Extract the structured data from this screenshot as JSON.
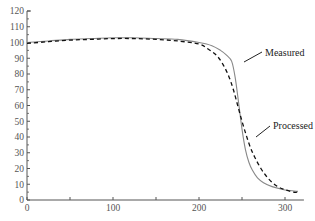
{
  "chart_data": {
    "type": "line",
    "title": "",
    "xlabel": "",
    "ylabel": "",
    "xlim": [
      0,
      320
    ],
    "ylim": [
      0,
      120
    ],
    "x_ticks": [
      0,
      100,
      200,
      300
    ],
    "y_ticks": [
      0,
      10,
      20,
      30,
      40,
      50,
      60,
      70,
      80,
      90,
      100,
      110,
      120
    ],
    "grid": false,
    "series": [
      {
        "name": "Measured",
        "style": "solid",
        "x": [
          0,
          25,
          50,
          75,
          100,
          125,
          150,
          175,
          200,
          215,
          225,
          232,
          238,
          242,
          246,
          250,
          254,
          258,
          262,
          268,
          275,
          285,
          295,
          305,
          315
        ],
        "y": [
          100,
          101,
          102,
          102.5,
          103,
          103,
          102.5,
          102,
          100,
          98,
          95,
          92,
          88,
          78,
          62,
          45,
          32,
          24,
          19,
          14,
          11,
          8.5,
          7,
          6,
          5.5
        ]
      },
      {
        "name": "Processed",
        "style": "dashed",
        "x": [
          0,
          25,
          50,
          75,
          100,
          125,
          150,
          175,
          200,
          210,
          220,
          228,
          235,
          240,
          245,
          250,
          255,
          260,
          265,
          272,
          280,
          290,
          300,
          310,
          315
        ],
        "y": [
          99.5,
          100.5,
          101.5,
          102,
          102.5,
          102.5,
          102,
          101,
          99,
          96,
          92,
          86,
          78,
          70,
          60,
          50,
          41,
          33,
          27,
          20,
          14,
          9,
          6.5,
          5,
          5
        ]
      }
    ],
    "annotations": [
      {
        "text": "Measured",
        "target_x": 238,
        "target_y": 88
      },
      {
        "text": "Processed",
        "target_x": 262,
        "target_y": 24
      }
    ]
  }
}
